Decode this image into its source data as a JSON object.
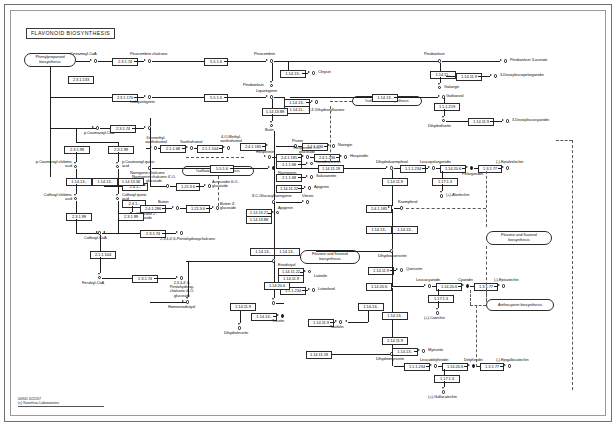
{
  "map": {
    "title": "FLAVONOID BIOSYNTHESIS",
    "id": "00941",
    "date": "6/22/07",
    "credit": "(c) Kanehisa Laboratories",
    "footer": "00941   6/22/07\n(c) Kanehisa Laboratories"
  },
  "map_links": [
    {
      "label": "Phenylpropanoid biosynthesis"
    },
    {
      "label": "Isoflavonoid biosynthesis"
    },
    {
      "label": "Isoflavonoid biosynthesis"
    },
    {
      "label": "Flavone and flavonol biosynthesis"
    },
    {
      "label": "Flavone and flavonol biosynthesis"
    },
    {
      "label": "Anthocyanin biosynthesis"
    }
  ],
  "compounds": [
    {
      "label": "Cinnamoyl-CoA"
    },
    {
      "label": "Pinocembrin chalcone"
    },
    {
      "label": "Pinocembrin"
    },
    {
      "label": "Chrysin"
    },
    {
      "label": "Pinobanksin"
    },
    {
      "label": "Pinobanksin 3-acetate"
    },
    {
      "label": "Galangin"
    },
    {
      "label": "3-Deoxyleucopelargonidin"
    },
    {
      "label": "Garbanzol"
    },
    {
      "label": "3-Deoxyleucocyanidin"
    },
    {
      "label": "Isoliquiritigenin"
    },
    {
      "label": "Liquiritigenin"
    },
    {
      "label": "7,4'-Dihydroxyflavone"
    },
    {
      "label": "Butin"
    },
    {
      "label": "Butein"
    },
    {
      "label": "Fustin"
    },
    {
      "label": "Dihydrofisetin"
    },
    {
      "label": "p-Coumaroyl-CoA"
    },
    {
      "label": "p-Coumaroyl shikimic acid"
    },
    {
      "label": "p-Coumaroyl quinic acid"
    },
    {
      "label": "Caffeoyl shikimic acid"
    },
    {
      "label": "Caffeoyl quinic acid"
    },
    {
      "label": "Caffeoyl-CoA"
    },
    {
      "label": "Feruloyl-CoA"
    },
    {
      "label": "Desmethyl- xanthohumol"
    },
    {
      "label": "Xanthohumol"
    },
    {
      "label": "4-O-Methyl- xanthohumol"
    },
    {
      "label": "Naringenin chalcone"
    },
    {
      "label": "Naringenin chalcone 4'-O-glucoside"
    },
    {
      "label": "Aureusidin 6-O-glucoside"
    },
    {
      "label": "Chalcone 2'-glucoside"
    },
    {
      "label": "2,3,4,4',6-Pentahydroxychalcone"
    },
    {
      "label": "2,3,4,4',6-Pentahydroxy- chalcone 4'-O-glucoside"
    },
    {
      "label": "Butein 4'-glucoside"
    },
    {
      "label": "Naringenin"
    },
    {
      "label": "Prunin"
    },
    {
      "label": "Naringin"
    },
    {
      "label": "Hesperetin"
    },
    {
      "label": "Hesperetin 7-O-glucoside"
    },
    {
      "label": "Hesperidin"
    },
    {
      "label": "Isosakuranetin"
    },
    {
      "label": "Sakuranetin"
    },
    {
      "label": "Apigenin"
    },
    {
      "label": "8-C-Glucosylnaringenin"
    },
    {
      "label": "Vitexin"
    },
    {
      "label": "Apigenin"
    },
    {
      "label": "Eriodictyol"
    },
    {
      "label": "Luteolin"
    },
    {
      "label": "Luteoforol"
    },
    {
      "label": "Homoeriodictyol"
    },
    {
      "label": "Tricetin"
    },
    {
      "label": "Dihydrotricetin"
    },
    {
      "label": "Dihydrokaempferol"
    },
    {
      "label": "Leucopelargonidin"
    },
    {
      "label": "Pelargonidin"
    },
    {
      "label": "(-)-Epiafzelechin"
    },
    {
      "label": "(+)-Afzelechin"
    },
    {
      "label": "Kaempferol"
    },
    {
      "label": "Dihydroquercetin"
    },
    {
      "label": "Quercetin"
    },
    {
      "label": "Leucocyanidin"
    },
    {
      "label": "Cyanidin"
    },
    {
      "label": "(-)-Epicatechin"
    },
    {
      "label": "(+)-Catechin"
    },
    {
      "label": "Dihydromyricetin"
    },
    {
      "label": "Myricetin"
    },
    {
      "label": "Leucodelphinidin"
    },
    {
      "label": "Delphinidin"
    },
    {
      "label": "(-)-Epigallocatechin"
    },
    {
      "label": "(+)-Gallocatechin"
    },
    {
      "label": "Taxifolin"
    }
  ],
  "enzymes": [
    {
      "ec": "2.3.1.74"
    },
    {
      "ec": "5.5.1.6"
    },
    {
      "ec": "1.14.13.-"
    },
    {
      "ec": "1.14.11.-"
    },
    {
      "ec": "1.14.13.-"
    },
    {
      "ec": "1.1.1.219"
    },
    {
      "ec": "1.14.11.9"
    },
    {
      "ec": "1.14.13.-"
    },
    {
      "ec": "1.1.1.219"
    },
    {
      "ec": "2.3.1.170"
    },
    {
      "ec": "5.5.1.6"
    },
    {
      "ec": "1.14.13.-"
    },
    {
      "ec": "1.14.11.-"
    },
    {
      "ec": "1.14.13.88"
    },
    {
      "ec": "1.14.11.9"
    },
    {
      "ec": "2.1.1.104"
    },
    {
      "ec": "2.3.1.133"
    },
    {
      "ec": "2.3.1.99"
    },
    {
      "ec": "1.14.13.-"
    },
    {
      "ec": "1.14.13.36"
    },
    {
      "ec": "2.3.1.99"
    },
    {
      "ec": "2.3.1.133"
    },
    {
      "ec": "1.14.13.-"
    },
    {
      "ec": "2.1.1.104"
    },
    {
      "ec": "2.3.1.170"
    },
    {
      "ec": "2.1.1.68"
    },
    {
      "ec": "2.3.1.74"
    },
    {
      "ec": "2.1.1.104"
    },
    {
      "ec": "2.1.1.104"
    },
    {
      "ec": "2.1.1.68"
    },
    {
      "ec": "2.4.1.-"
    },
    {
      "ec": "2.4.1.286"
    },
    {
      "ec": "1.21.3.6"
    },
    {
      "ec": "1.21.3.6"
    },
    {
      "ec": "2.4.1.286"
    },
    {
      "ec": "5.5.1.6"
    },
    {
      "ec": "1.14.11.22"
    },
    {
      "ec": "1.14.13.21"
    },
    {
      "ec": "1.14.13.88"
    },
    {
      "ec": "2.4.1.185"
    },
    {
      "ec": "1.14.11.9"
    },
    {
      "ec": "1.14.20.6"
    },
    {
      "ec": "1.17.1.3"
    },
    {
      "ec": "1.3.1.77"
    },
    {
      "ec": "1.14.13.-"
    },
    {
      "ec": "2.4.1.-"
    },
    {
      "ec": "2.4.1.185"
    },
    {
      "ec": "2.4.1.236"
    },
    {
      "ec": "2.4.1.185"
    },
    {
      "ec": "1.14.11.9"
    },
    {
      "ec": "1.14.20.6"
    },
    {
      "ec": "1.14.13.-"
    },
    {
      "ec": "1.14.11.9"
    },
    {
      "ec": "1.14.13.-"
    },
    {
      "ec": "1.1.1.234"
    },
    {
      "ec": "1.14.11.19"
    },
    {
      "ec": "1.14.11.9"
    },
    {
      "ec": "1.14.20.6"
    },
    {
      "ec": "1.17.1.3"
    },
    {
      "ec": "1.3.1.77"
    },
    {
      "ec": "1.14.13.-"
    },
    {
      "ec": "1.14.11.23"
    },
    {
      "ec": "1.14.11.9"
    },
    {
      "ec": "1.14.20.6"
    },
    {
      "ec": "1.17.1.3"
    },
    {
      "ec": "1.3.1.77"
    },
    {
      "ec": "1.14.11.9"
    },
    {
      "ec": "1.14.13.-"
    }
  ]
}
